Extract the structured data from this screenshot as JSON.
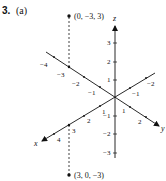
{
  "problem": {
    "number": "3.",
    "part": "(a)"
  },
  "points": [
    {
      "label": "(0, −3, 3)",
      "coords": [
        0,
        -3,
        3
      ]
    },
    {
      "label": "(3, 0, −3)",
      "coords": [
        3,
        0,
        -3
      ]
    }
  ],
  "axes": {
    "x": {
      "name": "x",
      "ticks_positive": [
        "1",
        "2",
        "3",
        "4"
      ],
      "ticks_negative": [
        "−1",
        "−2"
      ]
    },
    "y": {
      "name": "y",
      "ticks_positive": [
        "1",
        "2"
      ],
      "ticks_negative": [
        "−1",
        "−2",
        "−3",
        "−4"
      ]
    },
    "z": {
      "name": "z",
      "ticks_positive": [
        "1",
        "2",
        "3"
      ],
      "ticks_negative": [
        "−1",
        "−2",
        "−3"
      ]
    }
  },
  "colors": {
    "ink": "#111111",
    "background": "#ffffff"
  }
}
